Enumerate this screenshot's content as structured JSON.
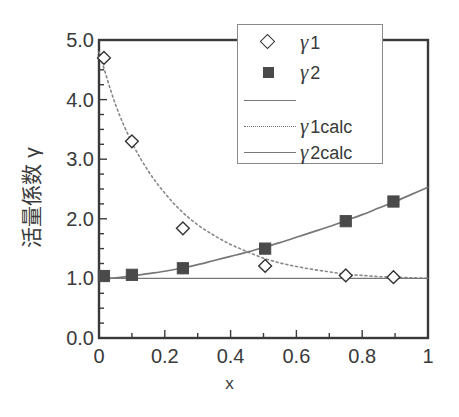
{
  "chart_data": {
    "type": "scatter",
    "title": "",
    "xlabel": "x",
    "ylabel": "活量係数 γ",
    "ylabel_chars": "活量係数 γ",
    "xlim": [
      0,
      1
    ],
    "ylim": [
      0,
      5
    ],
    "xticks": [
      "0",
      "0.2",
      "0.4",
      "0.6",
      "0.8",
      "1"
    ],
    "xtick_values": [
      0,
      0.2,
      0.4,
      0.6,
      0.8,
      1
    ],
    "yticks": [
      "0.0",
      "1.0",
      "2.0",
      "3.0",
      "4.0",
      "5.0"
    ],
    "ytick_values": [
      0,
      1,
      2,
      3,
      4,
      5
    ],
    "x_minor_tick_step": 0.1,
    "y_minor_tick_step": 0.25,
    "grid": false,
    "legend_position": "top-right",
    "frame": true,
    "series": [
      {
        "name": "γ1",
        "key": "gamma1",
        "marker": "open-diamond",
        "line": "none",
        "x": [
          0.015,
          0.1,
          0.255,
          0.505,
          0.75,
          0.895
        ],
        "values": [
          4.7,
          3.3,
          1.84,
          1.21,
          1.05,
          1.02
        ]
      },
      {
        "name": "γ2",
        "key": "gamma2",
        "marker": "filled-square",
        "line": "none",
        "x": [
          0.015,
          0.1,
          0.255,
          0.505,
          0.75,
          0.895
        ],
        "values": [
          1.04,
          1.06,
          1.17,
          1.5,
          1.96,
          2.29
        ]
      },
      {
        "name": "γ1calc",
        "key": "gamma1calc",
        "marker": "none",
        "line": "dotted",
        "x": [
          0.0,
          0.05,
          0.1,
          0.15,
          0.2,
          0.25,
          0.3,
          0.35,
          0.4,
          0.45,
          0.5,
          0.55,
          0.6,
          0.65,
          0.7,
          0.75,
          0.8,
          0.85,
          0.9,
          0.95,
          1.0
        ],
        "values": [
          4.8,
          3.92,
          3.28,
          2.8,
          2.43,
          2.13,
          1.9,
          1.72,
          1.57,
          1.45,
          1.34,
          1.26,
          1.2,
          1.15,
          1.11,
          1.07,
          1.05,
          1.03,
          1.02,
          1.01,
          1.0
        ]
      },
      {
        "name": "γ2calc",
        "key": "gamma2calc",
        "marker": "none",
        "line": "solid",
        "x": [
          0.0,
          0.05,
          0.1,
          0.15,
          0.2,
          0.25,
          0.3,
          0.35,
          0.4,
          0.45,
          0.5,
          0.55,
          0.6,
          0.65,
          0.7,
          0.75,
          0.8,
          0.85,
          0.9,
          0.95,
          1.0
        ],
        "values": [
          1.0,
          1.01,
          1.04,
          1.08,
          1.12,
          1.17,
          1.23,
          1.3,
          1.37,
          1.44,
          1.52,
          1.6,
          1.69,
          1.78,
          1.87,
          1.97,
          2.07,
          2.18,
          2.29,
          2.41,
          2.53
        ]
      },
      {
        "name": "",
        "key": "baseline",
        "marker": "none",
        "line": "solid-thin",
        "x": [
          0.0,
          1.0
        ],
        "values": [
          1.0,
          1.0
        ]
      }
    ],
    "colors": {
      "axis": "#3a3a3a",
      "marker_open": "#ffffff",
      "marker_open_edge": "#333333",
      "marker_filled": "#4a4a4a",
      "line_dotted": "#888888",
      "line_solid": "#777777",
      "legend_border": "#8a8a8a",
      "background": "#ffffff"
    }
  },
  "legend": {
    "entries": [
      {
        "label_gamma": "γ",
        "label_sub": "1",
        "key": "open-diamond"
      },
      {
        "label_gamma": "γ",
        "label_sub": "2",
        "key": "filled-square"
      },
      {
        "label_gamma": "",
        "label_sub": "",
        "key": "solid-thin-line"
      },
      {
        "label_gamma": "γ",
        "label_sub": "1calc",
        "key": "dotted-line"
      },
      {
        "label_gamma": "γ",
        "label_sub": "2calc",
        "key": "solid-line"
      }
    ]
  },
  "axes": {
    "x_title": "x",
    "y_title": "活量係数 γ",
    "x_tick_labels": [
      "0",
      "0.2",
      "0.4",
      "0.6",
      "0.8",
      "1"
    ],
    "y_tick_labels": [
      "5.0",
      "4.0",
      "3.0",
      "2.0",
      "1.0",
      "0.0"
    ]
  }
}
